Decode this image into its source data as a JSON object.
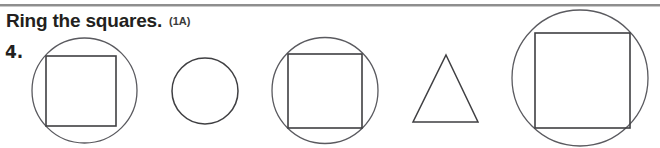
{
  "page": {
    "background_color": "#ffffff",
    "stroke_color": "#3f3f42",
    "width": 660,
    "height": 148
  },
  "header": {
    "instruction": "Ring the squares.",
    "code": "(1A)",
    "rule_color": "#8e8e8e"
  },
  "exercise": {
    "number": "4.",
    "task": "Ring the squares.",
    "items": [
      {
        "index": 1,
        "name": "ringed-square-1",
        "description": "circle drawn around a square",
        "is_ringed": true,
        "outer_shape": "circle",
        "inner_shape": "square",
        "circle": {
          "cx": 84.5,
          "cy": 90.5,
          "r": 52.5
        },
        "square": {
          "x": 46,
          "y": 56,
          "size": 70
        }
      },
      {
        "index": 2,
        "name": "circle-2",
        "description": "plain circle",
        "is_ringed": false,
        "outer_shape": "circle",
        "inner_shape": "none",
        "circle": {
          "cx": 205,
          "cy": 91,
          "r": 33
        },
        "square": null
      },
      {
        "index": 3,
        "name": "ringed-square-3",
        "description": "circle drawn around a square",
        "is_ringed": true,
        "outer_shape": "circle",
        "inner_shape": "square",
        "circle": {
          "cx": 325,
          "cy": 90.5,
          "r": 53
        },
        "square": {
          "x": 288,
          "y": 54,
          "size": 74
        }
      },
      {
        "index": 4,
        "name": "triangle-4",
        "description": "plain triangle",
        "is_ringed": false,
        "outer_shape": "triangle",
        "inner_shape": "none",
        "triangle": {
          "apex_x": 446,
          "apex_y": 55,
          "left_x": 413,
          "right_x": 478,
          "base_y": 122
        }
      },
      {
        "index": 5,
        "name": "ringed-square-5",
        "description": "large circle drawn around a large square",
        "is_ringed": true,
        "outer_shape": "circle",
        "inner_shape": "square",
        "circle": {
          "cx": 580,
          "cy": 78,
          "r": 68
        },
        "square": {
          "x": 535,
          "y": 33,
          "size": 95
        }
      }
    ]
  }
}
